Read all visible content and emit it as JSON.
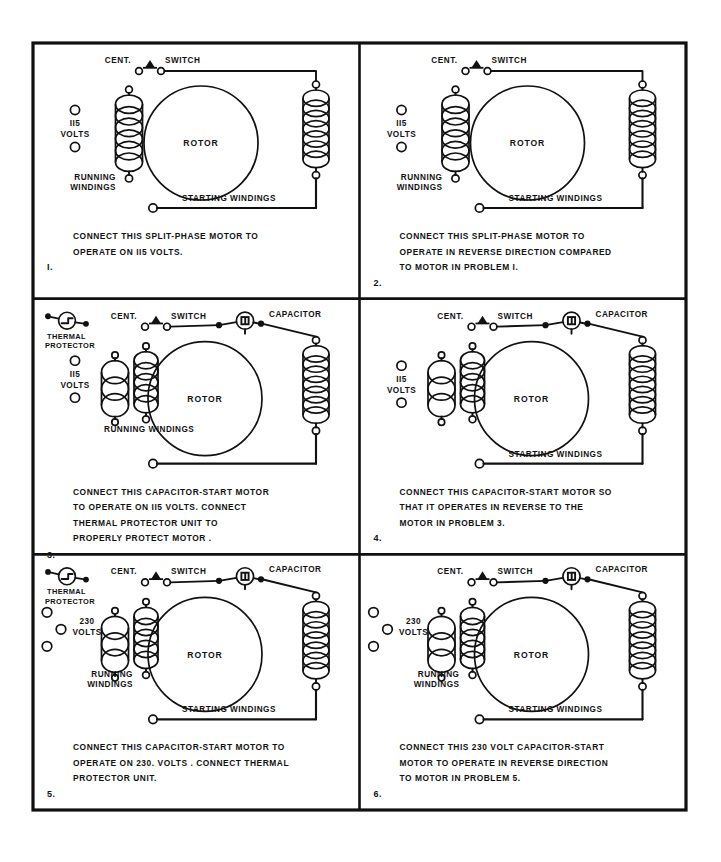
{
  "sheet": {
    "background": "#ffffff",
    "ink": "#111111",
    "border_color": "#111111",
    "width": 721,
    "height": 862,
    "grid": {
      "cols": 2,
      "rows": 3,
      "x0": 33,
      "y0": 43,
      "x1": 686,
      "y1": 810
    }
  },
  "common_labels": {
    "cent": "CENT.",
    "switch": "SWITCH",
    "capacitor": "CAPACITOR",
    "rotor": "ROTOR",
    "running": "RUNNING",
    "windings": "WINDINGS",
    "running_windings": "RUNNING WINDINGS",
    "starting_windings": "STARTING WINDINGS",
    "thermal": "THERMAL",
    "protector": "PROTECTOR",
    "volts": "VOLTS"
  },
  "panels": [
    {
      "id": "panel-1",
      "number": "I.",
      "voltage": "II5",
      "volts_label": "VOLTS",
      "supply_terminals": 2,
      "has_capacitor": false,
      "has_thermal_protector": false,
      "running_coils": 1,
      "rotor_label": "ROTOR",
      "running_label_split": true,
      "running_label_line1": "RUNNING",
      "running_label_line2": "WINDINGS",
      "starting_label": "STARTING WINDINGS",
      "caption": [
        "CONNECT THIS SPLIT-PHASE MOTOR TO",
        "OPERATE ON II5 VOLTS."
      ]
    },
    {
      "id": "panel-2",
      "number": "2.",
      "voltage": "II5",
      "volts_label": "VOLTS",
      "supply_terminals": 2,
      "has_capacitor": false,
      "has_thermal_protector": false,
      "running_coils": 1,
      "rotor_label": "ROTOR",
      "running_label_split": true,
      "running_label_line1": "RUNNING",
      "running_label_line2": "WINDINGS",
      "starting_label": "STARTING WINDINGS",
      "caption": [
        "CONNECT THIS SPLIT-PHASE MOTOR TO",
        "OPERATE IN REVERSE DIRECTION COMPARED",
        "TO MOTOR IN PROBLEM I."
      ]
    },
    {
      "id": "panel-3",
      "number": "3.",
      "voltage": "II5",
      "volts_label": "VOLTS",
      "supply_terminals": 2,
      "has_capacitor": true,
      "has_thermal_protector": true,
      "running_coils": 2,
      "rotor_label": "ROTOR",
      "running_label_split": false,
      "running_label_line1": "RUNNING  WINDINGS",
      "running_label_line2": "",
      "starting_label": "",
      "caption": [
        "CONNECT THIS CAPACITOR-START MOTOR",
        "TO OPERATE ON II5 VOLTS.   CONNECT",
        "THERMAL PROTECTOR UNIT TO",
        "PROPERLY PROTECT MOTOR ."
      ]
    },
    {
      "id": "panel-4",
      "number": "4.",
      "voltage": "II5",
      "volts_label": "VOLTS",
      "supply_terminals": 2,
      "has_capacitor": true,
      "has_thermal_protector": false,
      "running_coils": 2,
      "rotor_label": "ROTOR",
      "running_label_split": false,
      "running_label_line1": "",
      "running_label_line2": "",
      "starting_label": "STARTING WINDINGS",
      "caption": [
        "CONNECT THIS CAPACITOR-START MOTOR SO",
        "THAT IT OPERATES IN REVERSE TO THE",
        "MOTOR IN PROBLEM 3."
      ]
    },
    {
      "id": "panel-5",
      "number": "5.",
      "voltage": "230",
      "volts_label": "VOLTS",
      "supply_terminals": 3,
      "has_capacitor": true,
      "has_thermal_protector": true,
      "running_coils": 2,
      "rotor_label": "ROTOR",
      "running_label_split": true,
      "running_label_line1": "RUNNING",
      "running_label_line2": "WINDINGS",
      "starting_label": "STARTING WINDINGS",
      "caption": [
        "CONNECT THIS CAPACITOR-START MOTOR TO",
        "OPERATE ON 230. VOLTS .  CONNECT THERMAL",
        "PROTECTOR  UNIT."
      ]
    },
    {
      "id": "panel-6",
      "number": "6.",
      "voltage": "230",
      "volts_label": "VOLTS",
      "supply_terminals": 3,
      "has_capacitor": true,
      "has_thermal_protector": false,
      "running_coils": 2,
      "rotor_label": "ROTOR",
      "running_label_split": true,
      "running_label_line1": "RUNNING",
      "running_label_line2": "WINDINGS",
      "starting_label": "STARTING  WINDINGS",
      "caption": [
        "CONNECT THIS 230 VOLT CAPACITOR-START",
        "MOTOR TO OPERATE IN REVERSE DIRECTION",
        "TO MOTOR IN PROBLEM 5."
      ]
    }
  ]
}
